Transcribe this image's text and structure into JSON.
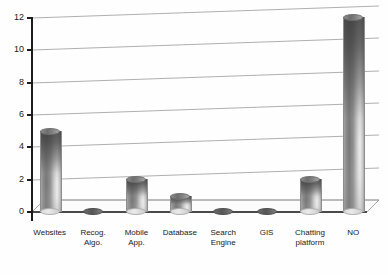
{
  "chart_data": {
    "type": "bar",
    "title": "",
    "subtitle": "",
    "xlabel": "",
    "ylabel": "",
    "ylim": [
      0,
      12
    ],
    "yticks": [
      0,
      2,
      4,
      6,
      8,
      10,
      12
    ],
    "grid": true,
    "legend": "none",
    "style": "3d-cylinder-grayscale",
    "categories": [
      "Websites",
      "Recog. Algo.",
      "Mobile App.",
      "Database",
      "Search Engine",
      "GIS",
      "Chatting platform",
      "NO"
    ],
    "category_lines": [
      [
        "Websites"
      ],
      [
        "Recog.",
        "Algo."
      ],
      [
        "Mobile",
        "App."
      ],
      [
        "Database"
      ],
      [
        "Search",
        "Engine"
      ],
      [
        "GIS"
      ],
      [
        "Chatting",
        "platform"
      ],
      [
        "NO"
      ]
    ],
    "values": [
      5,
      0,
      2,
      1,
      0,
      0,
      2,
      12
    ],
    "series": [
      {
        "name": "Count",
        "values": [
          5,
          0,
          2,
          1,
          0,
          0,
          2,
          12
        ]
      }
    ]
  },
  "axis": {
    "y_tick_labels": [
      "0",
      "2",
      "4",
      "6",
      "8",
      "10",
      "12"
    ]
  },
  "colors": {
    "background": "#ffffff",
    "axis": "#1c1c1c",
    "gridline": "#9a9a9a",
    "floor_edge": "#8f8f8f",
    "floor_fill": "#fbfbfb",
    "bar_dark": "#6e6e6e",
    "bar_light": "#ededed",
    "text": "#1a1a1a"
  }
}
